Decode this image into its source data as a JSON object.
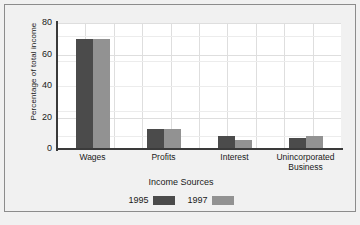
{
  "chart_data": {
    "type": "bar",
    "title": "",
    "xlabel": "Income Sources",
    "ylabel": "Percentage of total income",
    "categories": [
      "Wages",
      "Profits",
      "Interest",
      "Unincorporated Business"
    ],
    "category_lines": [
      [
        "Wages"
      ],
      [
        "Profits"
      ],
      [
        "Interest"
      ],
      [
        "Unincorporated",
        "Business"
      ]
    ],
    "series": [
      {
        "name": "1995",
        "color": "#4b4b4b",
        "values": [
          70,
          13,
          8,
          7
        ]
      },
      {
        "name": "1997",
        "color": "#929292",
        "values": [
          70,
          13,
          6,
          8
        ]
      }
    ],
    "ylim": [
      0,
      80
    ],
    "yticks": [
      0,
      20,
      40,
      60,
      80
    ],
    "ytick_labels": [
      "0",
      "20",
      "40",
      "60",
      "80"
    ],
    "grid": true,
    "grid_color": "#dedede",
    "legend_position": "bottom",
    "axis_color": "#3a3a3a",
    "plot_background": "#ffffff",
    "figure_background": "#f1f1f1"
  },
  "legend": {
    "items": [
      {
        "label": "1995"
      },
      {
        "label": "1997"
      }
    ]
  }
}
